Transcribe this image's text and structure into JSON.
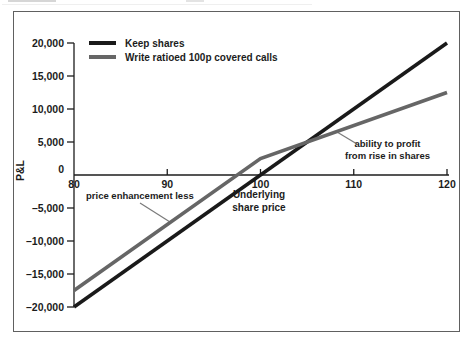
{
  "figure": {
    "background": "#ffffff",
    "frame_color": "#606060"
  },
  "chart_data": {
    "type": "line",
    "title": "",
    "xlabel": "Underlying share price",
    "ylabel": "P&L",
    "xlim": [
      80,
      120
    ],
    "ylim": [
      -20000,
      20000
    ],
    "grid": false,
    "legend_position": "top-left",
    "axis_color": "#1c1c1c",
    "x_ticks": [
      {
        "value": 80,
        "label": "80"
      },
      {
        "value": 90,
        "label": "90"
      },
      {
        "value": 100,
        "label": "100"
      },
      {
        "value": 110,
        "label": "110"
      },
      {
        "value": 120,
        "label": "120"
      }
    ],
    "y_ticks": [
      {
        "value": 20000,
        "label": "20,000"
      },
      {
        "value": 15000,
        "label": "15,000"
      },
      {
        "value": 10000,
        "label": "10,000"
      },
      {
        "value": 5000,
        "label": "5,000"
      },
      {
        "value": 0,
        "label": "0"
      },
      {
        "value": -5000,
        "label": "–5,000"
      },
      {
        "value": -10000,
        "label": "–10,000"
      },
      {
        "value": -15000,
        "label": "–15,000"
      },
      {
        "value": -20000,
        "label": "–20,000"
      }
    ],
    "series": [
      {
        "name": "Keep shares",
        "color": "#1a1a1a",
        "stroke_width": 3.6,
        "points": [
          [
            80,
            -20000
          ],
          [
            120,
            20000
          ]
        ]
      },
      {
        "name": "Write ratioed 100p covered calls",
        "color": "#666666",
        "stroke_width": 3.6,
        "points": [
          [
            80,
            -17500
          ],
          [
            100,
            2500
          ],
          [
            120,
            12500
          ]
        ]
      }
    ],
    "annotations": [
      {
        "text": "price enhancement less"
      },
      {
        "text": "Underlying share price",
        "line1": "Underlying",
        "line2": "share price"
      },
      {
        "text": "ability to profit from rise in shares",
        "line1": "ability to profit",
        "line2": "from rise in shares"
      }
    ]
  }
}
